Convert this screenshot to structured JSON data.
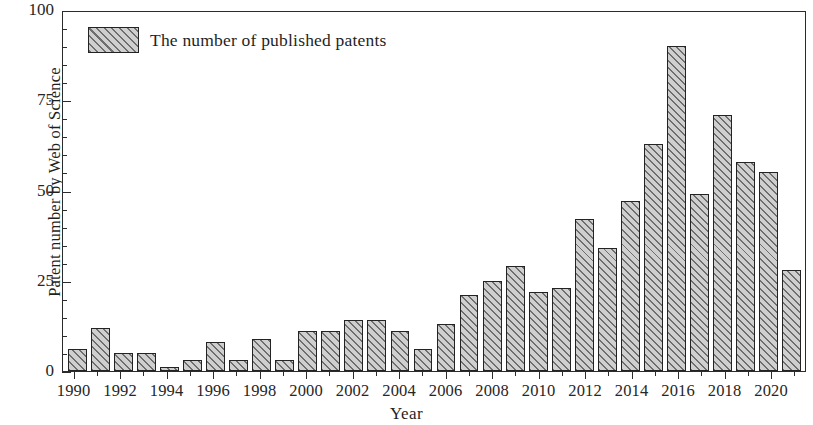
{
  "chart_data": {
    "type": "bar",
    "title": "",
    "xlabel": "Year",
    "ylabel": "Patent number by Web of Science",
    "legend": [
      "The number of published patents"
    ],
    "legend_position": "top-left inside plot",
    "grid": false,
    "ylim": [
      0,
      100
    ],
    "ytick_labels": [
      "0",
      "25",
      "50",
      "75",
      "100"
    ],
    "ytick_values": [
      0,
      25,
      50,
      75,
      100
    ],
    "yminor_interval": 5,
    "xtick_labels": [
      "1990",
      "1992",
      "1994",
      "1996",
      "1998",
      "2000",
      "2002",
      "2004",
      "2006",
      "2008",
      "2010",
      "2012",
      "2014",
      "2016",
      "2018",
      "2020"
    ],
    "categories": [
      "1990",
      "1991",
      "1992",
      "1993",
      "1994",
      "1995",
      "1996",
      "1997",
      "1998",
      "1999",
      "2000",
      "2001",
      "2002",
      "2003",
      "2004",
      "2005",
      "2006",
      "2007",
      "2008",
      "2009",
      "2010",
      "2011",
      "2012",
      "2013",
      "2014",
      "2015",
      "2016",
      "2017",
      "2018",
      "2019",
      "2020",
      "2021"
    ],
    "series": [
      {
        "name": "The number of published patents",
        "values": [
          6,
          12,
          5,
          5,
          1,
          3,
          8,
          3,
          9,
          3,
          11,
          11,
          14,
          14,
          11,
          6,
          13,
          21,
          25,
          29,
          22,
          23,
          42,
          34,
          47,
          63,
          90,
          49,
          71,
          58,
          55,
          28
        ]
      }
    ],
    "colors": {
      "bar_fill": "#cfcfcf",
      "bar_hatch": "#6e6e6e",
      "bar_edge": "#232323",
      "axis": "#2b2b2b",
      "text": "#1f1f1f",
      "background": "#ffffff"
    }
  }
}
